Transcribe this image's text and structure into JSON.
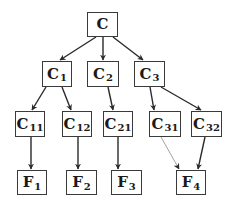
{
  "diagram": {
    "type": "tree",
    "colors": {
      "stroke": "#2a2a2a",
      "thin_stroke": "#7a7a7a",
      "box_border": "#3a3a3a",
      "text": "#1a1a1a",
      "background": "#ffffff"
    },
    "nodes": [
      {
        "id": "C",
        "base": "C",
        "sub": "",
        "x": 87,
        "y": 12,
        "w": 31,
        "h": 25
      },
      {
        "id": "C1",
        "base": "C",
        "sub": "1",
        "x": 42,
        "y": 61,
        "w": 30,
        "h": 26
      },
      {
        "id": "C2",
        "base": "C",
        "sub": "2",
        "x": 87,
        "y": 61,
        "w": 32,
        "h": 26
      },
      {
        "id": "C3",
        "base": "C",
        "sub": "3",
        "x": 134,
        "y": 61,
        "w": 31,
        "h": 26
      },
      {
        "id": "C11",
        "base": "C",
        "sub": "11",
        "x": 15,
        "y": 111,
        "w": 30,
        "h": 26
      },
      {
        "id": "C12",
        "base": "C",
        "sub": "12",
        "x": 62,
        "y": 111,
        "w": 30,
        "h": 26
      },
      {
        "id": "C21",
        "base": "C",
        "sub": "21",
        "x": 103,
        "y": 111,
        "w": 30,
        "h": 26
      },
      {
        "id": "C31",
        "base": "C",
        "sub": "31",
        "x": 149,
        "y": 111,
        "w": 32,
        "h": 26
      },
      {
        "id": "C32",
        "base": "C",
        "sub": "32",
        "x": 191,
        "y": 111,
        "w": 31,
        "h": 26
      },
      {
        "id": "F1",
        "base": "F",
        "sub": "1",
        "x": 17,
        "y": 170,
        "w": 30,
        "h": 25
      },
      {
        "id": "F2",
        "base": "F",
        "sub": "2",
        "x": 66,
        "y": 170,
        "w": 31,
        "h": 25
      },
      {
        "id": "F3",
        "base": "F",
        "sub": "3",
        "x": 111,
        "y": 170,
        "w": 31,
        "h": 25
      },
      {
        "id": "F4",
        "base": "F",
        "sub": "4",
        "x": 176,
        "y": 170,
        "w": 30,
        "h": 25
      }
    ],
    "edges": [
      {
        "from": "C",
        "to": "C1",
        "x1": 96,
        "y1": 37,
        "x2": 60,
        "y2": 60,
        "thin": false
      },
      {
        "from": "C",
        "to": "C2",
        "x1": 103,
        "y1": 37,
        "x2": 103,
        "y2": 60,
        "thin": false
      },
      {
        "from": "C",
        "to": "C3",
        "x1": 113,
        "y1": 37,
        "x2": 143,
        "y2": 60,
        "thin": false
      },
      {
        "from": "C1",
        "to": "C11",
        "x1": 46,
        "y1": 87,
        "x2": 32,
        "y2": 110,
        "thin": false
      },
      {
        "from": "C1",
        "to": "C12",
        "x1": 62,
        "y1": 87,
        "x2": 71,
        "y2": 110,
        "thin": false
      },
      {
        "from": "C2",
        "to": "C21",
        "x1": 108,
        "y1": 87,
        "x2": 113,
        "y2": 110,
        "thin": false
      },
      {
        "from": "C3",
        "to": "C31",
        "x1": 150,
        "y1": 87,
        "x2": 154,
        "y2": 110,
        "thin": false
      },
      {
        "from": "C3",
        "to": "C32",
        "x1": 161,
        "y1": 87,
        "x2": 201,
        "y2": 110,
        "thin": false
      },
      {
        "from": "C11",
        "to": "F1",
        "x1": 31,
        "y1": 137,
        "x2": 31,
        "y2": 169,
        "thin": false
      },
      {
        "from": "C12",
        "to": "F2",
        "x1": 78,
        "y1": 137,
        "x2": 78,
        "y2": 169,
        "thin": false
      },
      {
        "from": "C21",
        "to": "F3",
        "x1": 118,
        "y1": 137,
        "x2": 118,
        "y2": 169,
        "thin": false
      },
      {
        "from": "C31",
        "to": "F4",
        "x1": 161,
        "y1": 137,
        "x2": 179,
        "y2": 169,
        "thin": true
      },
      {
        "from": "C32",
        "to": "F4",
        "x1": 205,
        "y1": 137,
        "x2": 198,
        "y2": 169,
        "thin": false
      }
    ]
  }
}
